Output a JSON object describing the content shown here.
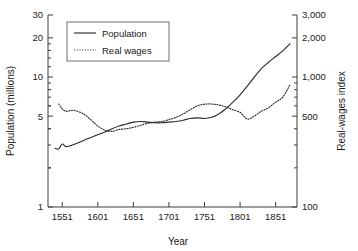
{
  "chart_data": {
    "type": "line",
    "title": "",
    "xlabel": "Year",
    "ylabel": "Population (millions)",
    "y2label": "Real-wages index",
    "grid": false,
    "legend_position": "top-left",
    "xscale": "linear",
    "yscale": "log",
    "y2scale": "log",
    "xlim": [
      1531,
      1881
    ],
    "ylim": [
      1,
      30
    ],
    "y2lim": [
      100,
      3000
    ],
    "xticks": [
      1551,
      1601,
      1651,
      1701,
      1751,
      1801,
      1851
    ],
    "xtick_labels": [
      "1551",
      "1601",
      "1651",
      "1701",
      "1751",
      "1801",
      "1851"
    ],
    "yticks": [
      1,
      5,
      10,
      20,
      30
    ],
    "ytick_labels": [
      "1",
      "5",
      "10",
      "20",
      "30"
    ],
    "y2ticks": [
      100,
      500,
      1000,
      2000,
      3000
    ],
    "y2tick_labels": [
      "100",
      "500",
      "1,000",
      "2,000",
      "3,000"
    ],
    "series": [
      {
        "name": "Population",
        "axis": "left",
        "style": "solid",
        "color": "#2b2b2b",
        "x": [
          1541,
          1546,
          1551,
          1556,
          1561,
          1571,
          1581,
          1591,
          1601,
          1611,
          1621,
          1631,
          1641,
          1651,
          1661,
          1671,
          1681,
          1691,
          1701,
          1711,
          1721,
          1731,
          1741,
          1751,
          1761,
          1771,
          1781,
          1791,
          1801,
          1811,
          1821,
          1831,
          1841,
          1851,
          1861,
          1871
        ],
        "y": [
          2.83,
          2.8,
          3.05,
          2.92,
          2.95,
          3.08,
          3.25,
          3.42,
          3.6,
          3.78,
          4.0,
          4.2,
          4.35,
          4.5,
          4.55,
          4.5,
          4.45,
          4.45,
          4.5,
          4.55,
          4.65,
          4.8,
          4.85,
          4.8,
          4.9,
          5.2,
          5.7,
          6.4,
          7.3,
          8.5,
          10.0,
          11.6,
          13.0,
          14.4,
          15.9,
          18.0
        ]
      },
      {
        "name": "Real wages",
        "axis": "right",
        "style": "dotted",
        "color": "#2b2b2b",
        "x": [
          1546,
          1551,
          1556,
          1561,
          1566,
          1571,
          1581,
          1591,
          1601,
          1611,
          1621,
          1631,
          1641,
          1651,
          1661,
          1671,
          1681,
          1691,
          1701,
          1711,
          1721,
          1731,
          1741,
          1751,
          1761,
          1771,
          1781,
          1791,
          1801,
          1806,
          1811,
          1816,
          1821,
          1831,
          1841,
          1851,
          1861,
          1871
        ],
        "y": [
          620,
          570,
          545,
          550,
          555,
          548,
          520,
          470,
          420,
          390,
          382,
          395,
          400,
          410,
          425,
          440,
          450,
          455,
          470,
          490,
          520,
          560,
          600,
          618,
          620,
          610,
          590,
          560,
          535,
          500,
          475,
          480,
          500,
          545,
          580,
          640,
          700,
          870
        ]
      }
    ],
    "legend_entries": [
      {
        "label": "Population",
        "style": "solid"
      },
      {
        "label": "Real wages",
        "style": "dotted"
      }
    ]
  }
}
